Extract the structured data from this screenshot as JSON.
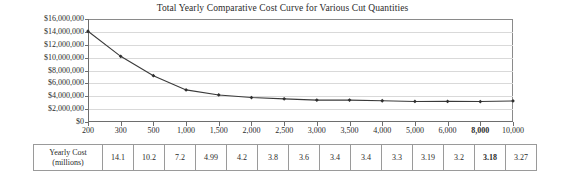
{
  "chart_data": {
    "type": "line",
    "title": "Total Yearly Comparative Cost Curve for Various Cut Quantities",
    "xlabel": "",
    "ylabel": "",
    "grid": true,
    "legend": "none",
    "ylim": [
      0,
      16000000
    ],
    "ytick_labels": [
      "$16,000,000",
      "$14,000,000",
      "$12,000,000",
      "$10,000,000",
      "$8,000,000",
      "$6,000,000",
      "$4,000,000",
      "$2,000,000",
      "$0"
    ],
    "ytick_values": [
      16000000,
      14000000,
      12000000,
      10000000,
      8000000,
      6000000,
      4000000,
      2000000,
      0
    ],
    "categories": [
      "200",
      "300",
      "500",
      "1,000",
      "1,500",
      "2,000",
      "2,500",
      "3,000",
      "3,500",
      "4,000",
      "5,000",
      "6,000",
      "8,000",
      "10,000"
    ],
    "highlighted_category": "8,000",
    "values": [
      14100000,
      10200000,
      7200000,
      4990000,
      4200000,
      3800000,
      3600000,
      3400000,
      3400000,
      3300000,
      3190000,
      3200000,
      3180000,
      3270000
    ],
    "series": [
      {
        "name": "Total Yearly Cost",
        "values": [
          14100000,
          10200000,
          7200000,
          4990000,
          4200000,
          3800000,
          3600000,
          3400000,
          3400000,
          3300000,
          3190000,
          3200000,
          3180000,
          3270000
        ]
      }
    ],
    "marker": "diamond",
    "line_color": "#3a3a3a"
  },
  "table": {
    "row_label_line1": "Yearly Cost",
    "row_label_line2": "(millions)",
    "values": [
      "14.1",
      "10.2",
      "7.2",
      "4.99",
      "4.2",
      "3.8",
      "3.6",
      "3.4",
      "3.4",
      "3.3",
      "3.19",
      "3.2",
      "3.18",
      "3.27"
    ],
    "bold_index": 12
  }
}
